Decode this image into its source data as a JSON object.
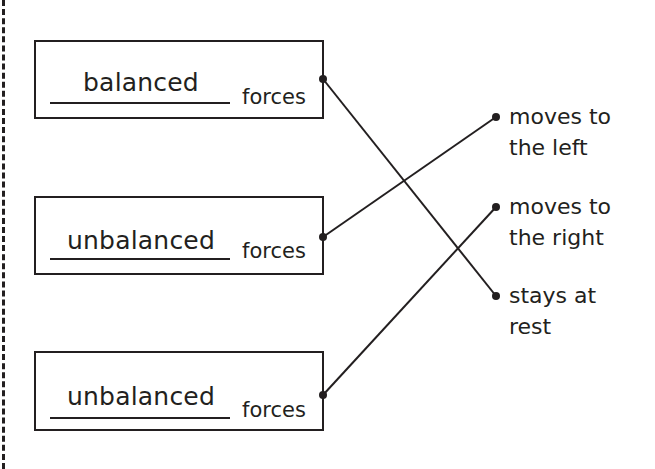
{
  "worksheet": {
    "left_items": [
      {
        "answer": "balanced",
        "label": "forces"
      },
      {
        "answer": "unbalanced",
        "label": "forces"
      },
      {
        "answer": "unbalanced",
        "label": "forces"
      }
    ],
    "right_options": [
      {
        "line1": "moves to",
        "line2": "the left"
      },
      {
        "line1": "moves to",
        "line2": "the right"
      },
      {
        "line1": "stays at",
        "line2": "rest"
      }
    ],
    "connections": [
      {
        "from": 0,
        "to": 2
      },
      {
        "from": 1,
        "to": 0
      },
      {
        "from": 2,
        "to": 1
      }
    ],
    "colors": {
      "ink": "#231f20",
      "background": "#ffffff"
    }
  }
}
